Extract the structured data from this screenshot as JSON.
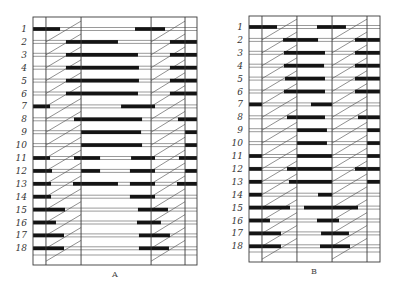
{
  "diagrams": [
    {
      "id": "A",
      "caption": "A",
      "row_labels": [
        "1",
        "2",
        "3",
        "4",
        "5",
        "6",
        "7",
        "8",
        "9",
        "10",
        "11",
        "12",
        "13",
        "14",
        "15",
        "16",
        "17",
        "18"
      ],
      "column_boundaries": [
        0,
        0.079,
        0.293,
        0.72,
        0.927,
        1.0
      ],
      "hatched_columns": [
        1,
        3
      ],
      "rows": [
        {
          "label": "1",
          "bars": [
            [
              0,
              0.165
            ],
            [
              0.622,
              0.805
            ]
          ]
        },
        {
          "label": "2",
          "bars": [
            [
              0.201,
              0.518
            ],
            [
              0.835,
              1.0
            ]
          ]
        },
        {
          "label": "3",
          "bars": [
            [
              0.201,
              0.64
            ],
            [
              0.835,
              1.0
            ]
          ]
        },
        {
          "label": "4",
          "bars": [
            [
              0.201,
              0.646
            ],
            [
              0.835,
              1.0
            ]
          ]
        },
        {
          "label": "5",
          "bars": [
            [
              0.201,
              0.646
            ],
            [
              0.835,
              1.0
            ]
          ]
        },
        {
          "label": "6",
          "bars": [
            [
              0.201,
              0.64
            ],
            [
              0.835,
              1.0
            ]
          ]
        },
        {
          "label": "7",
          "bars": [
            [
              0,
              0.104
            ],
            [
              0.537,
              0.744
            ]
          ]
        },
        {
          "label": "8",
          "bars": [
            [
              0.25,
              0.665
            ],
            [
              0.884,
              1.0
            ]
          ]
        },
        {
          "label": "9",
          "bars": [
            [
              0.293,
              0.659
            ],
            [
              0.927,
              1.0
            ]
          ]
        },
        {
          "label": "10",
          "bars": [
            [
              0.293,
              0.665
            ],
            [
              0.927,
              1.0
            ]
          ]
        },
        {
          "label": "11",
          "bars": [
            [
              0,
              0.104
            ],
            [
              0.25,
              0.409
            ],
            [
              0.598,
              0.744
            ],
            [
              0.89,
              1.0
            ]
          ]
        },
        {
          "label": "12",
          "bars": [
            [
              0,
              0.116
            ],
            [
              0.293,
              0.409
            ],
            [
              0.591,
              0.744
            ],
            [
              0.927,
              1.0
            ]
          ]
        },
        {
          "label": "13",
          "bars": [
            [
              0,
              0.11
            ],
            [
              0.244,
              0.518
            ],
            [
              0.591,
              0.744
            ],
            [
              0.878,
              1.0
            ]
          ]
        },
        {
          "label": "14",
          "bars": [
            [
              0,
              0.11
            ],
            [
              0.591,
              0.744
            ]
          ]
        },
        {
          "label": "15",
          "bars": [
            [
              0,
              0.195
            ],
            [
              0.64,
              0.823
            ]
          ]
        },
        {
          "label": "16",
          "bars": [
            [
              0,
              0.14
            ],
            [
              0.634,
              0.78
            ]
          ]
        },
        {
          "label": "17",
          "bars": [
            [
              0,
              0.189
            ],
            [
              0.646,
              0.835
            ]
          ]
        },
        {
          "label": "18",
          "bars": [
            [
              0,
              0.189
            ],
            [
              0.646,
              0.829
            ]
          ]
        }
      ]
    },
    {
      "id": "B",
      "caption": "B",
      "row_labels": [
        "1",
        "2",
        "3",
        "4",
        "5",
        "6",
        "7",
        "8",
        "9",
        "10",
        "11",
        "12",
        "13",
        "14",
        "15",
        "16",
        "17",
        "18"
      ],
      "column_boundaries": [
        0,
        0.099,
        0.366,
        0.634,
        0.901,
        1.0
      ],
      "hatched_columns": [
        1,
        3
      ],
      "rows": [
        {
          "label": "1",
          "bars": [
            [
              0,
              0.214
            ],
            [
              0.519,
              0.74
            ]
          ]
        },
        {
          "label": "2",
          "bars": [
            [
              0.26,
              0.527
            ],
            [
              0.809,
              1.0
            ]
          ]
        },
        {
          "label": "3",
          "bars": [
            [
              0.267,
              0.58
            ],
            [
              0.809,
              1.0
            ]
          ]
        },
        {
          "label": "4",
          "bars": [
            [
              0.267,
              0.573
            ],
            [
              0.809,
              1.0
            ]
          ]
        },
        {
          "label": "5",
          "bars": [
            [
              0.275,
              0.58
            ],
            [
              0.809,
              1.0
            ]
          ]
        },
        {
          "label": "6",
          "bars": [
            [
              0.267,
              0.58
            ],
            [
              0.809,
              1.0
            ]
          ]
        },
        {
          "label": "7",
          "bars": [
            [
              0,
              0.099
            ],
            [
              0.473,
              0.634
            ]
          ]
        },
        {
          "label": "8",
          "bars": [
            [
              0.29,
              0.58
            ],
            [
              0.832,
              1.0
            ]
          ]
        },
        {
          "label": "9",
          "bars": [
            [
              0.366,
              0.595
            ],
            [
              0.901,
              1.0
            ]
          ]
        },
        {
          "label": "10",
          "bars": [
            [
              0.366,
              0.595
            ],
            [
              0.901,
              1.0
            ]
          ]
        },
        {
          "label": "11",
          "bars": [
            [
              0,
              0.099
            ],
            [
              0.366,
              0.634
            ],
            [
              0.901,
              1.0
            ]
          ]
        },
        {
          "label": "12",
          "bars": [
            [
              0,
              0.099
            ],
            [
              0.29,
              0.634
            ],
            [
              0.809,
              1.0
            ]
          ]
        },
        {
          "label": "13",
          "bars": [
            [
              0,
              0.099
            ],
            [
              0.305,
              0.634
            ],
            [
              0.901,
              1.0
            ]
          ]
        },
        {
          "label": "14",
          "bars": [
            [
              0,
              0.099
            ],
            [
              0.527,
              0.634
            ]
          ]
        },
        {
          "label": "15",
          "bars": [
            [
              0,
              0.313
            ],
            [
              0.42,
              0.832
            ]
          ]
        },
        {
          "label": "16",
          "bars": [
            [
              0,
              0.16
            ],
            [
              0.519,
              0.687
            ]
          ]
        },
        {
          "label": "17",
          "bars": [
            [
              0,
              0.244
            ],
            [
              0.55,
              0.763
            ]
          ]
        },
        {
          "label": "18",
          "bars": [
            [
              0,
              0.244
            ],
            [
              0.542,
              0.771
            ]
          ]
        }
      ]
    }
  ],
  "colors": {
    "bar": "#141414",
    "line": "#3a3a3a",
    "background": "#ffffff"
  }
}
